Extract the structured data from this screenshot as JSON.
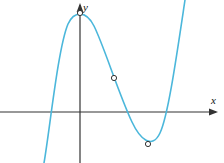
{
  "figure": {
    "width": 224,
    "height": 163,
    "background": "#ffffff"
  },
  "axes": {
    "color": "#333333",
    "stroke_width": 1.2,
    "origin": {
      "x": 80,
      "y": 112
    },
    "x_axis": {
      "label": "x",
      "label_position": {
        "x": 213,
        "y": 104
      },
      "start": {
        "x": 0,
        "y": 112
      },
      "end": {
        "x": 218,
        "y": 112
      },
      "arrow": "right"
    },
    "y_axis": {
      "label": "y",
      "label_position": {
        "x": 84,
        "y": 10
      },
      "start": {
        "x": 80,
        "y": 163
      },
      "end": {
        "x": 80,
        "y": 3
      },
      "arrow": "up"
    }
  },
  "curve": {
    "color": "#4bb7db",
    "stroke_width": 1.6,
    "path": "M 44,163 C 50,128 58,48 68,24 C 74,11 86,10 94,26 C 104,46 118,92 132,122 C 140,139 152,150 160,133 C 168,116 176,60 185,0",
    "description": "cubic polynomial with local maximum, inflection point and local minimum"
  },
  "markers": {
    "radius": 2.6,
    "fill": "#ffffff",
    "stroke": "#333333",
    "stroke_width": 1,
    "points": [
      {
        "name": "local-maximum",
        "x": 80,
        "y": 13
      },
      {
        "name": "inflection-point",
        "x": 114,
        "y": 78
      },
      {
        "name": "local-minimum",
        "x": 148,
        "y": 144
      }
    ]
  },
  "chart_data": {
    "type": "line",
    "title": "",
    "xlabel": "x",
    "ylabel": "y",
    "grid": false,
    "legend": null,
    "xlim": [
      -2.5,
      4.8
    ],
    "ylim": [
      -1.6,
      3.2
    ],
    "series": [
      {
        "name": "cubic curve",
        "color": "#4bb7db",
        "x": [
          -1.0,
          -0.6,
          -0.2,
          0.0,
          0.3,
          0.7,
          1.0,
          1.3,
          1.6,
          2.0,
          2.3,
          2.6,
          2.9,
          3.2,
          3.5,
          3.8
        ],
        "y": [
          -1.55,
          0.55,
          1.85,
          2.05,
          1.75,
          1.05,
          0.55,
          0.1,
          -0.3,
          -0.62,
          -0.68,
          -0.6,
          -0.3,
          0.25,
          1.1,
          2.3
        ]
      }
    ],
    "annotated_points": [
      {
        "label": "local maximum",
        "x": 0.0,
        "y": 2.05,
        "marker": "open-circle"
      },
      {
        "label": "inflection point",
        "x": 0.85,
        "y": 0.75,
        "marker": "open-circle"
      },
      {
        "label": "local minimum",
        "x": 2.4,
        "y": -0.68,
        "marker": "open-circle"
      }
    ],
    "x_intercepts": [
      -0.75,
      1.5,
      2.95
    ],
    "y_intercept": 2.05
  }
}
